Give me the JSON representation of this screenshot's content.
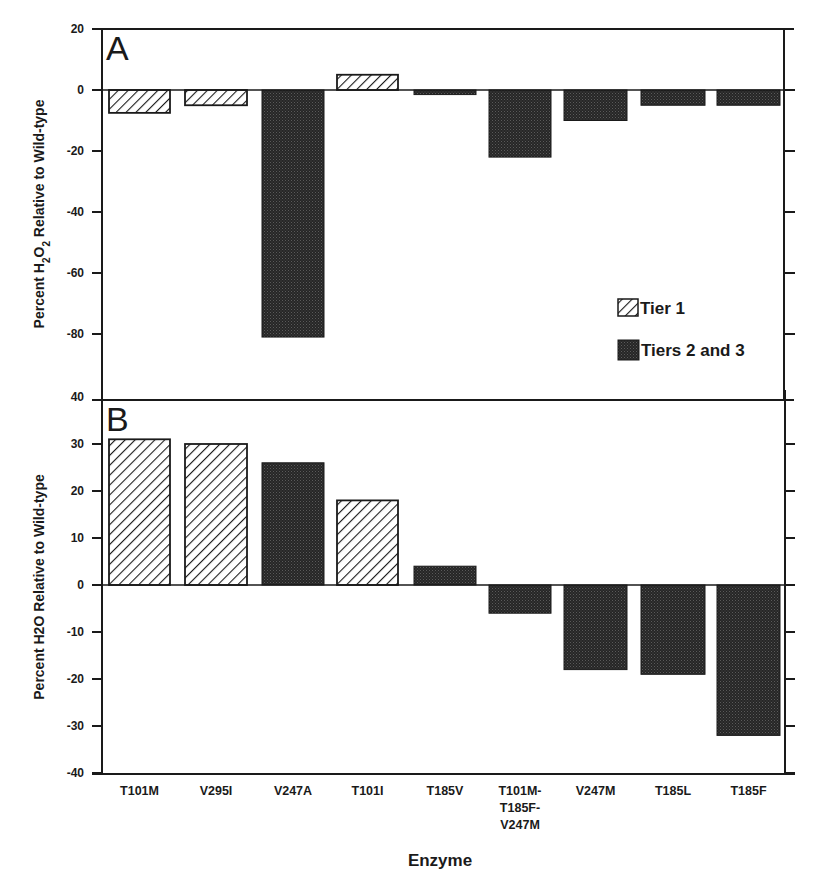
{
  "chart_data": [
    {
      "type": "bar",
      "panel": "A",
      "title": "",
      "xlabel": "Enzyme",
      "ylabel": "Percent H2O2 Relative to Wild-type",
      "ylim": [
        -90,
        20
      ],
      "yticks": [
        20,
        0,
        -20,
        -40,
        -60,
        -80
      ],
      "grid": false,
      "categories": [
        "T101M",
        "V295I",
        "V247A",
        "T101I",
        "T185V",
        "T101M-T185F-V247M",
        "V247M",
        "T185L",
        "T185F"
      ],
      "values": [
        -7.5,
        -5,
        -81,
        5,
        -1.5,
        -22,
        -10,
        -5,
        -5
      ],
      "tiers": [
        "Tier 1",
        "Tier 1",
        "Tiers 2 and 3",
        "Tier 1",
        "Tiers 2 and 3",
        "Tiers 2 and 3",
        "Tiers 2 and 3",
        "Tiers 2 and 3",
        "Tiers 2 and 3"
      ],
      "legend": {
        "position": "right-inside",
        "entries": [
          "Tier 1",
          "Tiers 2 and 3"
        ]
      }
    },
    {
      "type": "bar",
      "panel": "B",
      "title": "",
      "xlabel": "Enzyme",
      "ylabel": "Percent H2O Relative to Wild-type",
      "ylim": [
        -40,
        40
      ],
      "yticks": [
        40,
        30,
        20,
        10,
        0,
        -10,
        -20,
        -30,
        -40
      ],
      "grid": false,
      "categories": [
        "T101M",
        "V295I",
        "V247A",
        "T101I",
        "T185V",
        "T101M-T185F-V247M",
        "V247M",
        "T185L",
        "T185F"
      ],
      "values": [
        31,
        30,
        26,
        18,
        4,
        -6,
        -18,
        -19,
        -32
      ],
      "tiers": [
        "Tier 1",
        "Tier 1",
        "Tiers 2 and 3",
        "Tier 1",
        "Tiers 2 and 3",
        "Tiers 2 and 3",
        "Tiers 2 and 3",
        "Tiers 2 and 3",
        "Tiers 2 and 3"
      ]
    }
  ],
  "panels": {
    "a": {
      "letter": "A",
      "ylabel_prefix": "Percent H",
      "ylabel_sub1": "2",
      "ylabel_mid": "O",
      "ylabel_sub2": "2",
      "ylabel_suffix": " Relative to Wild-type",
      "ticks": [
        "20",
        "0",
        "-20",
        "-40",
        "-60",
        "-80"
      ]
    },
    "b": {
      "letter": "B",
      "ylabel": "Percent H2O Relative to Wild-type",
      "ticks": [
        "40",
        "30",
        "20",
        "10",
        "0",
        "-10",
        "-20",
        "-30",
        "-40"
      ]
    }
  },
  "legend": {
    "tier1": "Tier 1",
    "tier23": "Tiers 2 and 3"
  },
  "x_axis": {
    "title": "Enzyme",
    "categories": [
      {
        "lines": [
          "T101M"
        ]
      },
      {
        "lines": [
          "V295I"
        ]
      },
      {
        "lines": [
          "V247A"
        ]
      },
      {
        "lines": [
          "T101I"
        ]
      },
      {
        "lines": [
          "T185V"
        ]
      },
      {
        "lines": [
          "T101M-",
          "T185F-",
          "V247M"
        ]
      },
      {
        "lines": [
          "V247M"
        ]
      },
      {
        "lines": [
          "T185L"
        ]
      },
      {
        "lines": [
          "T185F"
        ]
      }
    ]
  },
  "colors": {
    "axis": "#1a1a1a",
    "hatch_fill": "#ffffff",
    "hatch_line": "#1a1a1a",
    "dark_fill": "#2b2b2b",
    "dark_dot": "#4a4a4a"
  }
}
